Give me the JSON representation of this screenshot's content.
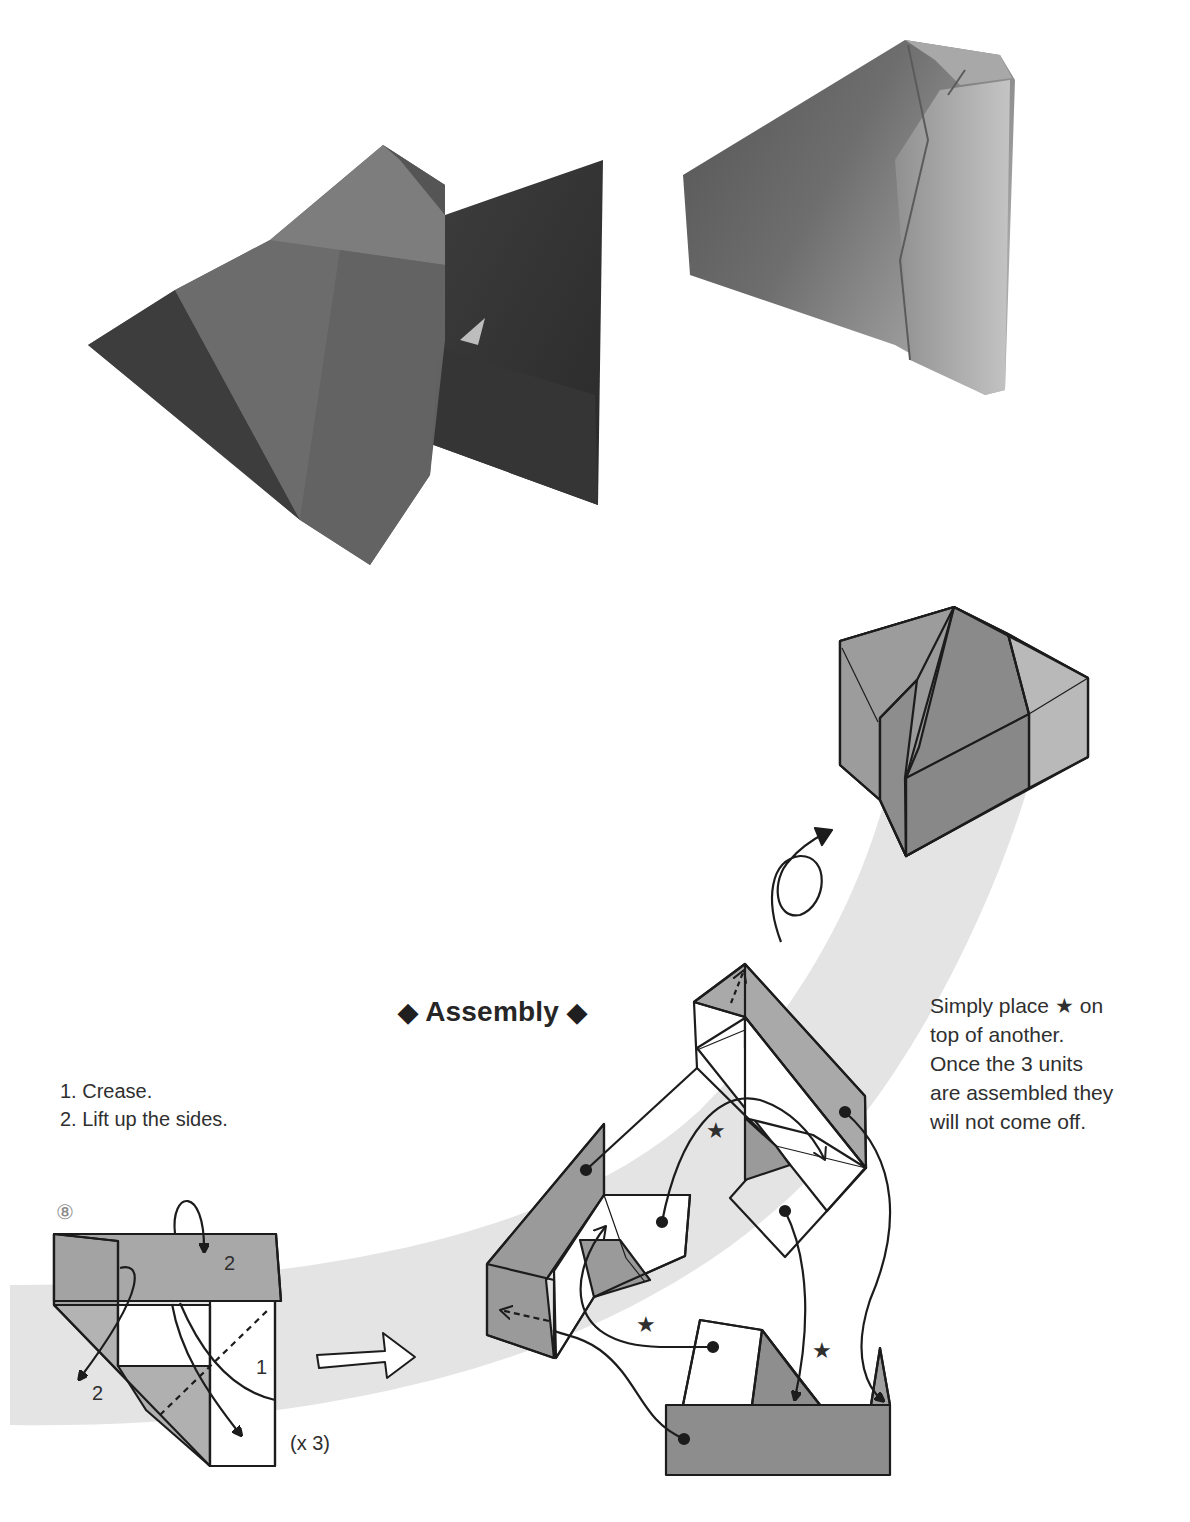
{
  "photos": {
    "left": {
      "label": "photo-two-pyramid-units"
    },
    "right": {
      "label": "photo-assembled-model"
    }
  },
  "assembly": {
    "title": "Assembly",
    "title_marker": "◆",
    "note_lines": [
      "Simply place ★ on",
      "top of another.",
      "Once the 3 units",
      "are assembled they",
      "will not come off."
    ]
  },
  "step8": {
    "number": "⑧",
    "instructions": [
      "1. Crease.",
      "2. Lift up the sides."
    ],
    "label_1": "1",
    "label_2a": "2",
    "label_2b": "2",
    "repeat": "(x 3)"
  },
  "stars": [
    "★",
    "★",
    "★"
  ],
  "colors": {
    "band": "#e3e3e3",
    "paper_gray": "#8f8f8f",
    "paper_light": "#b2b2b2",
    "paper_dark": "#7a7a7a",
    "line": "#1c1c1c"
  }
}
